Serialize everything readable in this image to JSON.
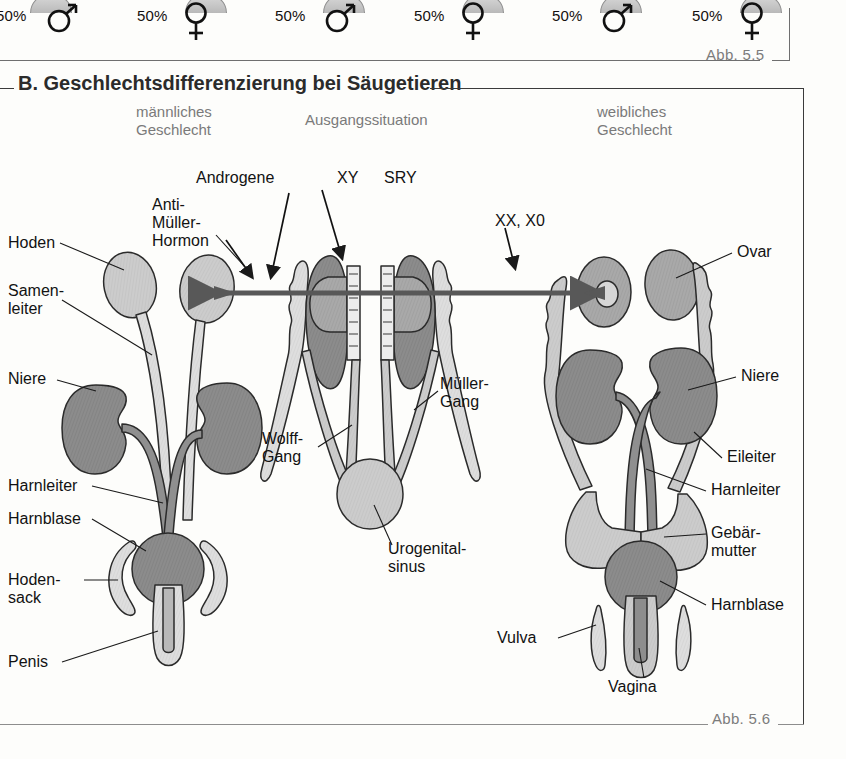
{
  "previous_figure": {
    "caption": "Abb. 5.5",
    "outcomes": [
      {
        "percent": "50%",
        "symbol": "male"
      },
      {
        "percent": "50%",
        "symbol": "female"
      },
      {
        "percent": "50%",
        "symbol": "male"
      },
      {
        "percent": "50%",
        "symbol": "female"
      },
      {
        "percent": "50%",
        "symbol": "male"
      },
      {
        "percent": "50%",
        "symbol": "female"
      }
    ]
  },
  "figure": {
    "section_letter": "B.",
    "title": "B. Geschlechtsdifferenzierung bei Säugetieren",
    "caption": "Abb. 5.6",
    "columns": [
      {
        "key": "male",
        "line1": "männliches",
        "line2": "Geschlecht"
      },
      {
        "key": "initial",
        "line1": "Ausgangssituation",
        "line2": ""
      },
      {
        "key": "female",
        "line1": "weibliches",
        "line2": "Geschlecht"
      }
    ],
    "labels_left": [
      {
        "key": "hoden",
        "text": "Hoden"
      },
      {
        "key": "samenleiter",
        "line1": "Samen-",
        "line2": "leiter"
      },
      {
        "key": "niere_l",
        "text": "Niere"
      },
      {
        "key": "harnleiter_l",
        "text": "Harnleiter"
      },
      {
        "key": "harnblase_l",
        "text": "Harnblase"
      },
      {
        "key": "hodensack",
        "line1": "Hoden-",
        "line2": "sack"
      },
      {
        "key": "penis",
        "text": "Penis"
      }
    ],
    "labels_center": [
      {
        "key": "anti_mueller",
        "line1": "Anti-",
        "line2": "Müller-",
        "line3": "Hormon"
      },
      {
        "key": "androgene",
        "text": "Androgene"
      },
      {
        "key": "xy",
        "text": "XY"
      },
      {
        "key": "sry",
        "text": "SRY"
      },
      {
        "key": "xx_x0",
        "text": "XX, X0"
      },
      {
        "key": "wolff",
        "line1": "Wolff-",
        "line2": "Gang"
      },
      {
        "key": "mueller",
        "line1": "Müller-",
        "line2": "Gang"
      },
      {
        "key": "urogenital",
        "line1": "Urogenital-",
        "line2": "sinus"
      }
    ],
    "labels_right": [
      {
        "key": "ovar",
        "text": "Ovar"
      },
      {
        "key": "niere_r",
        "text": "Niere"
      },
      {
        "key": "eileiter",
        "text": "Eileiter"
      },
      {
        "key": "harnleiter_r",
        "text": "Harnleiter"
      },
      {
        "key": "gebaermutter",
        "line1": "Gebär-",
        "line2": "mutter"
      },
      {
        "key": "harnblase_r",
        "text": "Harnblase"
      },
      {
        "key": "vulva",
        "text": "Vulva"
      },
      {
        "key": "vagina",
        "text": "Vagina"
      }
    ]
  },
  "colors": {
    "dark_organ": "#8c8c8c",
    "mid_organ": "#a8a8a8",
    "light_organ": "#cccccc",
    "pale_organ": "#dcdcdc",
    "outline": "#2b2b2b",
    "arrow": "#555555",
    "frame": "#3b3b3b",
    "caption_gray": "#7c7c7c",
    "header_gray": "#7a7a7a"
  }
}
